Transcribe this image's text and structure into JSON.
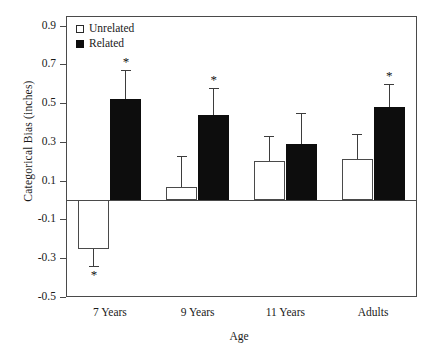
{
  "chart_data": {
    "type": "bar",
    "title": "",
    "xlabel": "Age",
    "ylabel": "Categorical Bias (inches)",
    "categories": [
      "7 Years",
      "9 Years",
      "11 Years",
      "Adults"
    ],
    "ylim": [
      -0.5,
      0.95
    ],
    "yticks": [
      -0.5,
      -0.3,
      -0.1,
      0.1,
      0.3,
      0.5,
      0.7,
      0.9
    ],
    "ytick_labels": [
      "-0.5",
      "-0.3",
      "-0.1",
      "0.1",
      "0.3",
      "0.5",
      "0.7",
      "0.9"
    ],
    "grid": false,
    "legend_position": "upper-left-inside",
    "zero_line": true,
    "error_bar_style": "upper-cap-only",
    "series": [
      {
        "name": "Unrelated",
        "fill": "#ffffff",
        "edge": "#4a4a4a",
        "values": [
          -0.25,
          0.07,
          0.2,
          0.21
        ],
        "errors": [
          0.09,
          0.16,
          0.13,
          0.13
        ],
        "significant": [
          true,
          false,
          false,
          false
        ]
      },
      {
        "name": "Related",
        "fill": "#0d0d0d",
        "edge": "#0d0d0d",
        "values": [
          0.52,
          0.44,
          0.29,
          0.48
        ],
        "errors": [
          0.15,
          0.14,
          0.16,
          0.12
        ],
        "significant": [
          true,
          true,
          false,
          true
        ]
      }
    ],
    "annotations": {
      "significance_marker": "*",
      "note": "Asterisk denotes bias significantly different from zero"
    }
  },
  "legend": {
    "items": [
      {
        "label": "Unrelated",
        "swatch": "open-square"
      },
      {
        "label": "Related",
        "swatch": "filled-square"
      }
    ]
  },
  "axes": {
    "y_title": "Categorical Bias (inches)",
    "x_title": "Age"
  }
}
